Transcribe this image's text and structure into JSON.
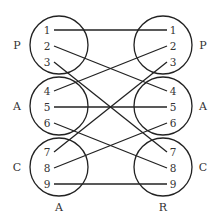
{
  "diagram": {
    "type": "bipartite-mapping",
    "left_column": {
      "bottom_label": "A",
      "groups": [
        {
          "label": "P",
          "items": [
            "1",
            "2",
            "3"
          ]
        },
        {
          "label": "A",
          "items": [
            "4",
            "5",
            "6"
          ]
        },
        {
          "label": "C",
          "items": [
            "7",
            "8",
            "9"
          ]
        }
      ]
    },
    "right_column": {
      "bottom_label": "R",
      "groups": [
        {
          "label": "P",
          "items": [
            "1",
            "2",
            "3"
          ]
        },
        {
          "label": "A",
          "items": [
            "4",
            "5",
            "6"
          ]
        },
        {
          "label": "C",
          "items": [
            "7",
            "8",
            "9"
          ]
        }
      ]
    },
    "connections": [
      {
        "from": "1",
        "to": "1"
      },
      {
        "from": "2",
        "to": "4"
      },
      {
        "from": "3",
        "to": "7"
      },
      {
        "from": "4",
        "to": "2"
      },
      {
        "from": "5",
        "to": "5"
      },
      {
        "from": "6",
        "to": "8"
      },
      {
        "from": "7",
        "to": "3"
      },
      {
        "from": "8",
        "to": "6"
      },
      {
        "from": "9",
        "to": "9"
      }
    ],
    "colors": {
      "stroke": "#222222",
      "text": "#333333",
      "background": "#ffffff"
    }
  }
}
